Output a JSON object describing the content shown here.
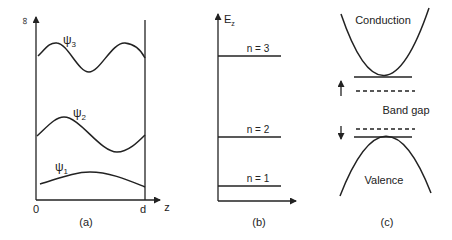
{
  "panel_a": {
    "caption": "(a)",
    "y_axis_label": "∞",
    "x_origin_label": "0",
    "x_end_label": "d",
    "x_axis_label": "z",
    "wavefunctions": [
      {
        "label": "ψ",
        "subscript": "1"
      },
      {
        "label": "ψ",
        "subscript": "2"
      },
      {
        "label": "ψ",
        "subscript": "3"
      }
    ]
  },
  "panel_b": {
    "caption": "(b)",
    "y_axis_label": "E",
    "y_axis_subscript": "z",
    "levels": [
      {
        "label": "n = 1"
      },
      {
        "label": "n = 2"
      },
      {
        "label": "n = 3"
      }
    ]
  },
  "panel_c": {
    "caption": "(c)",
    "conduction_label": "Conduction",
    "gap_label": "Band gap",
    "valence_label": "Valence"
  }
}
